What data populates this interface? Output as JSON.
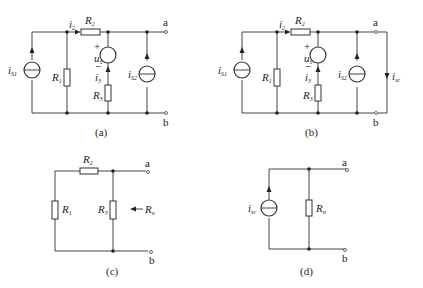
{
  "figure": {
    "top_caption_partial": "",
    "bottom_caption_partial": ""
  },
  "panels": {
    "a": {
      "caption": "(a)",
      "terminal_a": "a",
      "terminal_b": "b",
      "labels": {
        "iS1": "i",
        "iS1_sub": "S1",
        "R1": "R",
        "R1_sub": "1",
        "i2": "i",
        "i2_sub": "2",
        "R2": "R",
        "R2_sub": "2",
        "uS": "u",
        "uS_sub": "S",
        "plus": "+",
        "minus": "−",
        "i3": "i",
        "i3_sub": "3",
        "R3": "R",
        "R3_sub": "3",
        "iS2": "i",
        "iS2_sub": "S2"
      }
    },
    "b": {
      "caption": "(b)",
      "terminal_a": "a",
      "terminal_b": "b",
      "labels": {
        "iS1": "i",
        "iS1_sub": "S1",
        "R1": "R",
        "R1_sub": "1",
        "i2": "i",
        "i2_sub": "2",
        "R2": "R",
        "R2_sub": "2",
        "uS": "u",
        "uS_sub": "S",
        "plus": "+",
        "minus": "−",
        "i3": "i",
        "i3_sub": "3",
        "R3": "R",
        "R3_sub": "3",
        "iS2": "i",
        "iS2_sub": "S2",
        "isc": "i",
        "isc_sub": "sc"
      }
    },
    "c": {
      "caption": "(c)",
      "terminal_a": "a",
      "terminal_b": "b",
      "labels": {
        "R1": "R",
        "R1_sub": "1",
        "R2": "R",
        "R2_sub": "2",
        "R3": "R",
        "R3_sub": "3",
        "Ro": "R",
        "Ro_sub": "o"
      }
    },
    "d": {
      "caption": "(d)",
      "terminal_a": "a",
      "terminal_b": "b",
      "labels": {
        "isc": "i",
        "isc_sub": "sc",
        "Ro": "R",
        "Ro_sub": "o"
      }
    }
  }
}
